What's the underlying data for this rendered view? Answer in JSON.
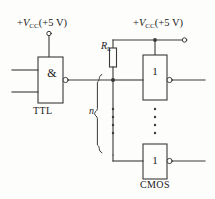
{
  "diagram": {
    "supply_left": {
      "label_prefix": "+",
      "label_symbol": "V",
      "label_subscript": "CC",
      "label_value": "(+5 V)",
      "full": "+VCC(+5 V)"
    },
    "supply_right": {
      "label_prefix": "+",
      "label_symbol": "V",
      "label_subscript": "CC",
      "label_value": "(+5 V)",
      "full": "+VCC(+5 V)"
    },
    "resistor": {
      "symbol": "R",
      "subscript": "L",
      "name": "pull-up-resistor"
    },
    "fanout": {
      "label": "n",
      "meaning": "n identical CMOS loads"
    },
    "gates": [
      {
        "id": "ttl-nand",
        "symbol": "&",
        "family_label": "TTL",
        "inverting": true,
        "inputs": 2
      },
      {
        "id": "cmos-inverter-top",
        "symbol": "1",
        "family_label": "",
        "inverting": true,
        "inputs": 1
      },
      {
        "id": "cmos-inverter-bottom",
        "symbol": "1",
        "family_label": "CMOS",
        "inverting": true,
        "inputs": 1
      }
    ],
    "ellipsis": {
      "glyph": "⋮",
      "columns": 2
    },
    "colors": {
      "line": "#3a3a3a",
      "text": "#1a1a1a",
      "background": "#fdfdfc"
    }
  }
}
